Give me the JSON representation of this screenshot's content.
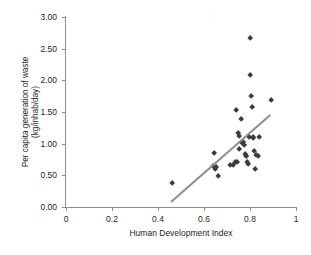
{
  "chart_data": {
    "type": "scatter",
    "title": "",
    "xlabel": "Human Development Index",
    "ylabel": "Per capita generation of waste (kg/inhab/day)",
    "ylabel_line1": "Per capita generation of waste",
    "ylabel_line2": "(kg/inhab/day)",
    "xlim": [
      0,
      1
    ],
    "ylim": [
      0,
      3
    ],
    "grid": false,
    "legend": "none",
    "xticks": [
      "0",
      "0.2",
      "0.4",
      "0.6",
      "0.8",
      "1"
    ],
    "xtick_values": [
      0,
      0.2,
      0.4,
      0.6,
      0.8,
      1
    ],
    "yticks": [
      "0.00",
      "0.50",
      "1.00",
      "1.50",
      "2.00",
      "2.50",
      "3.00"
    ],
    "ytick_values": [
      0,
      0.5,
      1.0,
      1.5,
      2.0,
      2.5,
      3.0
    ],
    "point_color": "#3a3a42",
    "trendline_color": "#8d8d8d",
    "axis_color": "#8d8d8d",
    "marker": "diamond",
    "points": [
      {
        "x": 0.46,
        "y": 0.37
      },
      {
        "x": 0.645,
        "y": 0.85
      },
      {
        "x": 0.64,
        "y": 0.64
      },
      {
        "x": 0.648,
        "y": 0.6
      },
      {
        "x": 0.652,
        "y": 0.63
      },
      {
        "x": 0.66,
        "y": 0.49
      },
      {
        "x": 0.715,
        "y": 0.66
      },
      {
        "x": 0.725,
        "y": 0.665
      },
      {
        "x": 0.735,
        "y": 0.7
      },
      {
        "x": 0.745,
        "y": 0.7
      },
      {
        "x": 0.74,
        "y": 1.53
      },
      {
        "x": 0.748,
        "y": 1.17
      },
      {
        "x": 0.752,
        "y": 1.12
      },
      {
        "x": 0.755,
        "y": 0.92
      },
      {
        "x": 0.762,
        "y": 1.39
      },
      {
        "x": 0.765,
        "y": 1.03
      },
      {
        "x": 0.768,
        "y": 1.0
      },
      {
        "x": 0.772,
        "y": 1.02
      },
      {
        "x": 0.775,
        "y": 0.98
      },
      {
        "x": 0.778,
        "y": 0.83
      },
      {
        "x": 0.782,
        "y": 0.81
      },
      {
        "x": 0.785,
        "y": 0.8
      },
      {
        "x": 0.788,
        "y": 0.7
      },
      {
        "x": 0.792,
        "y": 0.67
      },
      {
        "x": 0.795,
        "y": 1.1
      },
      {
        "x": 0.8,
        "y": 2.66
      },
      {
        "x": 0.802,
        "y": 2.08
      },
      {
        "x": 0.805,
        "y": 1.75
      },
      {
        "x": 0.808,
        "y": 1.58
      },
      {
        "x": 0.812,
        "y": 1.09
      },
      {
        "x": 0.815,
        "y": 1.11
      },
      {
        "x": 0.818,
        "y": 0.88
      },
      {
        "x": 0.822,
        "y": 0.6
      },
      {
        "x": 0.828,
        "y": 0.82
      },
      {
        "x": 0.835,
        "y": 0.81
      },
      {
        "x": 0.84,
        "y": 1.1
      },
      {
        "x": 0.89,
        "y": 1.68
      }
    ],
    "trendline": {
      "x1": 0.455,
      "y1": 0.1,
      "x2": 0.885,
      "y2": 1.47
    }
  }
}
